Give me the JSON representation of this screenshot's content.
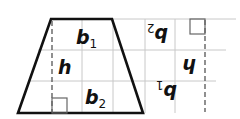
{
  "figure": {
    "colors": {
      "edge": "#111111",
      "grid": "#c8c8c8",
      "dashed_height": "#555555",
      "background": "#ffffff"
    },
    "trapezoid": {
      "labels": {
        "top_base": {
          "main": "b",
          "sub": "1"
        },
        "height": "h",
        "bottom_base": {
          "main": "b",
          "sub": "2"
        }
      }
    },
    "rotated_trapezoid": {
      "rotation_degrees": 180,
      "labels": {
        "top_base": {
          "main": "b",
          "sub": "2"
        },
        "height": "h",
        "bottom_base": {
          "main": "b",
          "sub": "1"
        }
      }
    },
    "right_angle_markers": 2,
    "dashed_height_lines": 2
  }
}
